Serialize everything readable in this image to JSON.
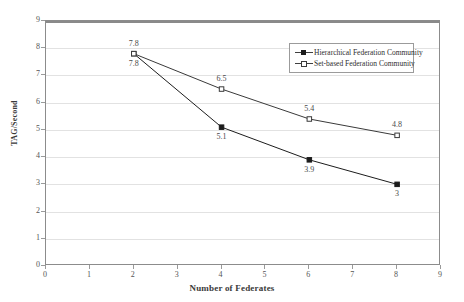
{
  "chart_data": {
    "type": "line",
    "title": "",
    "xlabel": "Number of Federates",
    "ylabel": "TAG/Second",
    "xlim": [
      0,
      9
    ],
    "ylim": [
      0,
      9
    ],
    "xticks": [
      "0",
      "1",
      "2",
      "3",
      "4",
      "5",
      "6",
      "7",
      "8",
      "9"
    ],
    "yticks": [
      "0",
      "1",
      "2",
      "3",
      "4",
      "5",
      "6",
      "7",
      "8",
      "9"
    ],
    "grid": "horizontal",
    "legend_position": "upper-right-inside",
    "x": [
      2,
      4,
      6,
      8
    ],
    "series": [
      {
        "name": "Hierarchical Federation Community",
        "marker": "filled-square",
        "color": "#1c1c1c",
        "values": [
          7.8,
          5.1,
          3.9,
          3
        ],
        "labels": [
          "7.8",
          "5.1",
          "3.9",
          "3"
        ],
        "label_position": "below"
      },
      {
        "name": "Set-based Federation Community",
        "marker": "open-square",
        "color": "#3a3a3a",
        "values": [
          7.8,
          6.5,
          5.4,
          4.8
        ],
        "labels": [
          "7.8",
          "6.5",
          "5.4",
          "4.8"
        ],
        "label_position": "above"
      }
    ]
  },
  "legend": {
    "entries": [
      {
        "label": "Hierarchical Federation Community"
      },
      {
        "label": "Set-based Federation Community"
      }
    ]
  }
}
